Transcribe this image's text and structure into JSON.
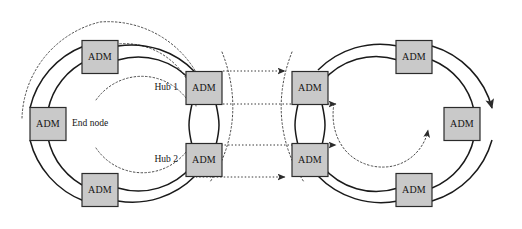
{
  "diagram": {
    "colors": {
      "node_fill": "#c9c9c9",
      "node_border": "#2b2b2b",
      "ring_solid": "#1a1a1a",
      "ring_dotted": "#4a4a4a",
      "link_dotted": "#3a3a3a",
      "background": "#ffffff"
    },
    "left_ring": {
      "name": "left-ring",
      "nodes": [
        {
          "id": "left-top",
          "label": "ADM",
          "x": 100,
          "y": 57
        },
        {
          "id": "left-west",
          "label": "ADM",
          "x": 48,
          "y": 124
        },
        {
          "id": "left-bottom",
          "label": "ADM",
          "x": 100,
          "y": 190
        },
        {
          "id": "hub-1",
          "label": "ADM",
          "x": 204,
          "y": 88
        },
        {
          "id": "hub-2",
          "label": "ADM",
          "x": 204,
          "y": 160
        }
      ]
    },
    "right_ring": {
      "name": "right-ring",
      "nodes": [
        {
          "id": "right-hub-top",
          "label": "ADM",
          "x": 310,
          "y": 88
        },
        {
          "id": "right-hub-bottom",
          "label": "ADM",
          "x": 310,
          "y": 160
        },
        {
          "id": "right-top",
          "label": "ADM",
          "x": 414,
          "y": 57
        },
        {
          "id": "right-east",
          "label": "ADM",
          "x": 462,
          "y": 124
        },
        {
          "id": "right-bottom",
          "label": "ADM",
          "x": 414,
          "y": 190
        }
      ]
    },
    "annotations": [
      {
        "id": "hub-1-label",
        "text": "Hub 1",
        "x": 178,
        "y": 88,
        "align": "end"
      },
      {
        "id": "hub-2-label",
        "text": "Hub 2",
        "x": 178,
        "y": 160,
        "align": "end"
      },
      {
        "id": "end-node-label",
        "text": "End node",
        "x": 72,
        "y": 124,
        "align": "start"
      }
    ],
    "interconnects": [
      {
        "id": "link-top",
        "from": "hub-1",
        "to": "right-hub-top",
        "style": "dotted",
        "arrow": "end"
      },
      {
        "id": "link-mid",
        "from": "hub-1",
        "to": "right-ring-inner",
        "style": "dotted",
        "arrow": "end"
      },
      {
        "id": "link-lower-mid",
        "from": "hub-2",
        "to": "right-ring-inner",
        "style": "dotted",
        "arrow": "end"
      },
      {
        "id": "link-bottom",
        "from": "hub-2",
        "to": "right-hub-bottom",
        "style": "dotted",
        "arrow": "end"
      }
    ],
    "node_size": {
      "width": 36,
      "height": 33
    }
  }
}
